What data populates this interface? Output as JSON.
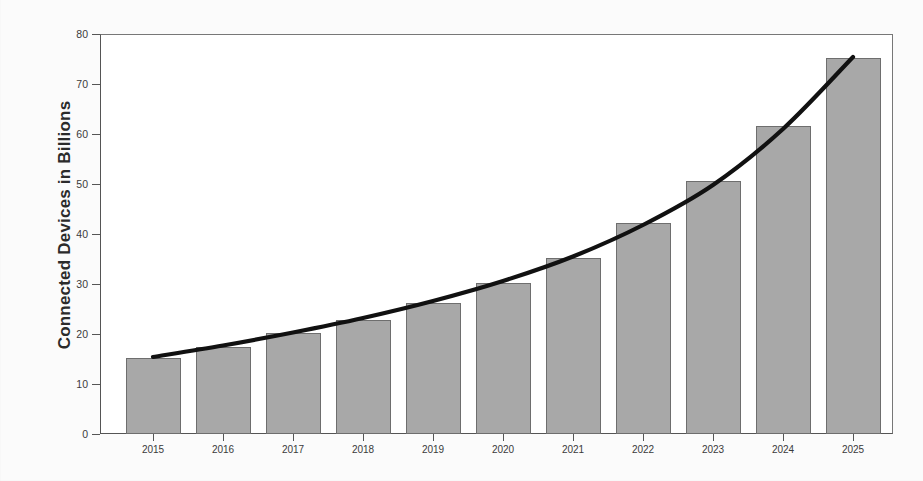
{
  "chart_data": {
    "type": "bar",
    "title": "",
    "subtitle": "",
    "xlabel": "",
    "ylabel": "Connected Devices in Billions",
    "categories": [
      "2015",
      "2016",
      "2017",
      "2018",
      "2019",
      "2020",
      "2021",
      "2022",
      "2023",
      "2024",
      "2025"
    ],
    "values": [
      15.2,
      17.5,
      20.2,
      22.8,
      26.3,
      30.2,
      35.3,
      42.3,
      50.7,
      61.7,
      75.2
    ],
    "series": [
      {
        "name": "Connected devices (bars)",
        "type": "bar",
        "values": [
          15.2,
          17.5,
          20.2,
          22.8,
          26.3,
          30.2,
          35.3,
          42.3,
          50.7,
          61.7,
          75.2
        ]
      },
      {
        "name": "Trend line",
        "type": "line",
        "values": [
          15.4,
          17.7,
          20.3,
          23.2,
          26.6,
          30.6,
          35.5,
          41.8,
          49.8,
          61.0,
          75.4
        ]
      }
    ],
    "ylim": [
      0,
      80
    ],
    "yticks": [
      0,
      10,
      20,
      30,
      40,
      50,
      60,
      70,
      80
    ],
    "ytick_labels": [
      "0",
      "10",
      "20",
      "30",
      "40",
      "50",
      "60",
      "70",
      "80"
    ],
    "grid": false,
    "legend": false,
    "legend_position": "none",
    "bar_color": "#a8a8a8",
    "bar_edge_color": "#6e6e6e",
    "line_color": "#111111",
    "axis_color": "#555555",
    "background_color": "#ffffff"
  }
}
